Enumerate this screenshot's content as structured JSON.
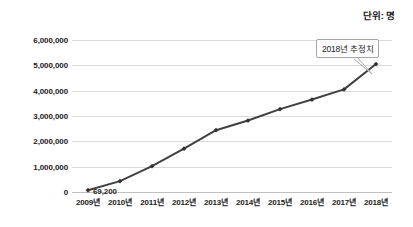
{
  "unit_caption": "단위: 명",
  "callout": {
    "text": "2018년 추정치"
  },
  "first_point_label": "69,200",
  "chart_data": {
    "type": "line",
    "title": "",
    "subtitle": "",
    "xlabel": "",
    "ylabel": "",
    "unit": "단위: 명",
    "categories": [
      "2009년",
      "2010년",
      "2011년",
      "2012년",
      "2013년",
      "2014년",
      "2015년",
      "2016년",
      "2017년",
      "2018년"
    ],
    "series": [
      {
        "name": "누적 인원",
        "values": [
          69200,
          430000,
          1020000,
          1710000,
          2440000,
          2820000,
          3270000,
          3650000,
          4050000,
          5050000
        ]
      }
    ],
    "ylim": [
      0,
      6000000
    ],
    "ytick_values": [
      0,
      1000000,
      2000000,
      3000000,
      4000000,
      5000000,
      6000000
    ],
    "ytick_labels": [
      "0",
      "1,000,000",
      "2,000,000",
      "3,000,000",
      "4,000,000",
      "5,000,000",
      "6,000,000"
    ],
    "grid": true,
    "legend": false,
    "legend_position": "none",
    "line_color": "#404040",
    "marker_color": "#333333",
    "grid_color": "#d9d9d9",
    "data_labels": [
      {
        "category": "2009년",
        "text": "69,200"
      }
    ],
    "annotations": [
      {
        "category": "2018년",
        "text": "2018년 추정치"
      }
    ]
  }
}
